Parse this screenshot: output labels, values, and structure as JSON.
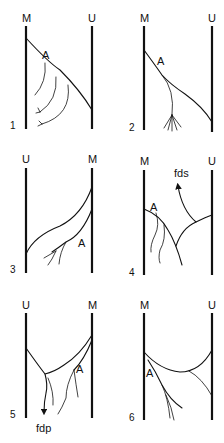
{
  "panels": [
    {
      "number": "1",
      "left_label": "M",
      "right_label": "U",
      "vessel_label": "A"
    },
    {
      "number": "2",
      "left_label": "M",
      "right_label": "U",
      "vessel_label": "A"
    },
    {
      "number": "3",
      "left_label": "U",
      "right_label": "M",
      "vessel_label": "A"
    },
    {
      "number": "4",
      "left_label": "M",
      "right_label": "U",
      "vessel_label": "A",
      "arrow_label": "fds"
    },
    {
      "number": "5",
      "left_label": "U",
      "right_label": "M",
      "vessel_label": "A",
      "arrow_label": "fdp"
    },
    {
      "number": "6",
      "left_label": "M",
      "right_label": "U",
      "vessel_label": "A"
    }
  ],
  "colors": {
    "line": "#111111",
    "background": "#ffffff"
  }
}
